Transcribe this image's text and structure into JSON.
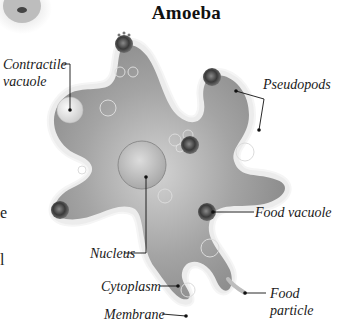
{
  "title": "Amoeba",
  "labels": {
    "contractile_vacuole_1": "Contractile",
    "contractile_vacuole_2": "vacuole",
    "pseudopods": "Pseudopods",
    "food_vacuole": "Food vacuole",
    "nucleus": "Nucleus",
    "cytoplasm": "Cytoplasm",
    "membrane": "Membrane",
    "food_particle_1": "Food",
    "food_particle_2": "particle"
  },
  "edge_fragments": {
    "frag_1": "e",
    "frag_2": "l"
  },
  "colors": {
    "cytoplasm": "#9a9a9a",
    "membrane": "#e8e8e8",
    "leader_line": "#111111"
  }
}
